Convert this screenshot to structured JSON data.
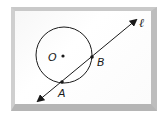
{
  "diagram": {
    "type": "circle-secant",
    "colors": {
      "stroke": "#1a1a1a",
      "frame_border": "#c4c4c4",
      "background": "#ffffff"
    },
    "circle": {
      "center_label": "O",
      "cx": 64,
      "cy": 55,
      "r": 28
    },
    "points": [
      {
        "label": "A",
        "x": 62,
        "y": 82
      },
      {
        "label": "B",
        "x": 92,
        "y": 57
      }
    ],
    "line": {
      "label": "ℓ",
      "x1": 38,
      "y1": 101,
      "x2": 136,
      "y2": 20,
      "arrows": "both"
    },
    "labels": {
      "center": "O",
      "point_a": "A",
      "point_b": "B",
      "line": "ℓ"
    }
  }
}
